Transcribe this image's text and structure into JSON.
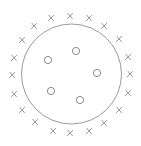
{
  "diagram": {
    "type": "set-classification",
    "boundary_circle": {
      "cx": 71.5,
      "cy": 74,
      "r": 50,
      "color": "#9a9a9a"
    },
    "inside_points": {
      "marker": "circle",
      "color": "#8a8a8a",
      "radius": 3.6,
      "points": [
        {
          "x": 76,
          "y": 51
        },
        {
          "x": 48,
          "y": 60
        },
        {
          "x": 97,
          "y": 73
        },
        {
          "x": 51,
          "y": 91
        },
        {
          "x": 80,
          "y": 100
        }
      ]
    },
    "outside_points": {
      "marker": "x",
      "color": "#8a8a8a",
      "size": 2.6,
      "points": [
        {
          "x": 70,
          "y": 16
        },
        {
          "x": 89,
          "y": 18
        },
        {
          "x": 104,
          "y": 26
        },
        {
          "x": 119,
          "y": 39
        },
        {
          "x": 128,
          "y": 57
        },
        {
          "x": 130,
          "y": 74
        },
        {
          "x": 128,
          "y": 93
        },
        {
          "x": 119,
          "y": 110
        },
        {
          "x": 104,
          "y": 123
        },
        {
          "x": 89,
          "y": 131
        },
        {
          "x": 70,
          "y": 133
        },
        {
          "x": 53,
          "y": 131
        },
        {
          "x": 35,
          "y": 122
        },
        {
          "x": 22,
          "y": 110
        },
        {
          "x": 14,
          "y": 94
        },
        {
          "x": 12,
          "y": 75
        },
        {
          "x": 14,
          "y": 58
        },
        {
          "x": 22,
          "y": 40
        },
        {
          "x": 34,
          "y": 26
        },
        {
          "x": 51,
          "y": 18
        }
      ]
    }
  }
}
